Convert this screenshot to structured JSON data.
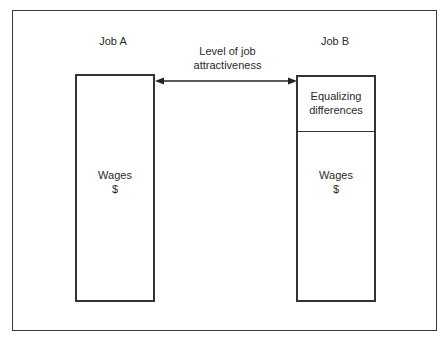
{
  "diagram": {
    "job_a": {
      "title": "Job A",
      "segment": {
        "label_line1": "Wages",
        "label_line2": "$"
      }
    },
    "job_b": {
      "title": "Job B",
      "top_segment": {
        "label_line1": "Equalizing",
        "label_line2": "differences"
      },
      "bottom_segment": {
        "label_line1": "Wages",
        "label_line2": "$"
      }
    },
    "arrow": {
      "label_line1": "Level of job",
      "label_line2": "attractiveness",
      "direction": "bidirectional"
    },
    "colors": {
      "stroke": "#333333",
      "background": "#ffffff",
      "text": "#2a2a2a"
    }
  }
}
